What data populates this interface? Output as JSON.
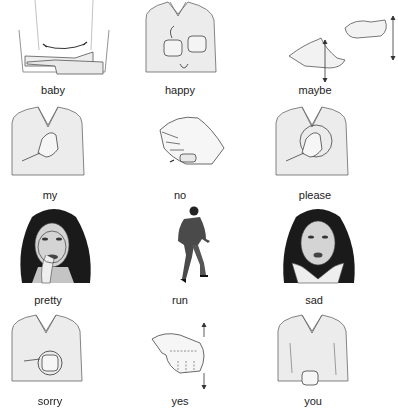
{
  "colors": {
    "skin_shade": "#e6e6e6",
    "outline": "#555555",
    "hair": "#1a1a1a",
    "suit": "#4a4a4a",
    "label": "#222222"
  },
  "signs": [
    {
      "word": "baby",
      "icon": "cradling-arms-icon"
    },
    {
      "word": "happy",
      "icon": "fists-circling-chest-icon"
    },
    {
      "word": "maybe",
      "icon": "alternating-palms-icon"
    },
    {
      "word": "my",
      "icon": "hand-on-chest-icon"
    },
    {
      "word": "no",
      "icon": "fingers-snap-thumb-icon"
    },
    {
      "word": "please",
      "icon": "palm-circling-chest-icon"
    },
    {
      "word": "pretty",
      "icon": "hand-circling-face-icon"
    },
    {
      "word": "run",
      "icon": "walking-man-icon"
    },
    {
      "word": "sad",
      "icon": "hands-on-cheeks-face-icon"
    },
    {
      "word": "sorry",
      "icon": "fist-circling-chest-icon"
    },
    {
      "word": "yes",
      "icon": "nodding-fist-icon"
    },
    {
      "word": "you",
      "icon": "pointing-hand-torso-icon"
    }
  ]
}
